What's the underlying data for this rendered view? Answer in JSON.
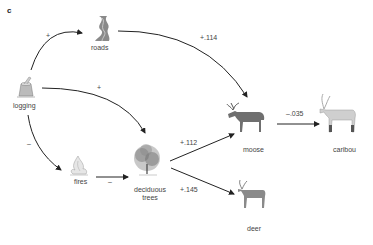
{
  "panel_label": "c",
  "nodes": {
    "roads": {
      "label": "roads",
      "icon": "road-icon"
    },
    "logging": {
      "label": "logging",
      "icon": "tree-stump-icon"
    },
    "fires": {
      "label": "fires",
      "icon": "fire-icon"
    },
    "trees": {
      "label": "deciduous trees",
      "line1": "deciduous",
      "line2": "trees",
      "icon": "tree-icon"
    },
    "moose": {
      "label": "moose",
      "icon": "moose-icon"
    },
    "caribou": {
      "label": "caribou",
      "icon": "caribou-icon"
    },
    "deer": {
      "label": "deer",
      "icon": "deer-icon"
    }
  },
  "edges": [
    {
      "from": "logging",
      "to": "roads",
      "sign": "+"
    },
    {
      "from": "logging",
      "to": "deciduous trees",
      "sign": "+"
    },
    {
      "from": "logging",
      "to": "fires",
      "sign": "–"
    },
    {
      "from": "fires",
      "to": "deciduous trees",
      "sign": "–"
    },
    {
      "from": "roads",
      "to": "moose",
      "sign": "+.114"
    },
    {
      "from": "deciduous trees",
      "to": "moose",
      "sign": "+.112"
    },
    {
      "from": "deciduous trees",
      "to": "deer",
      "sign": "+.145"
    },
    {
      "from": "moose",
      "to": "caribou",
      "sign": "–.035"
    }
  ],
  "colors": {
    "arrow": "#222222",
    "text": "#444444"
  }
}
